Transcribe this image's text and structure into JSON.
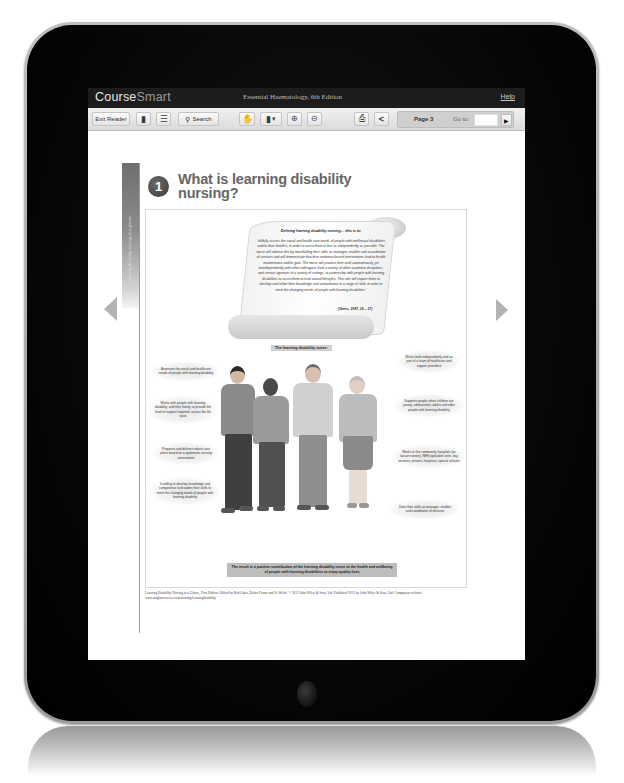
{
  "app": {
    "logo_main": "Course",
    "logo_accent": "Smart",
    "book_title": "Essential Haematology, 6th Edition",
    "help_label": "Help"
  },
  "toolbar": {
    "exit_reader_label": "Exit Reader",
    "page_icon": "page-icon",
    "toc_icon": "list-icon",
    "search_label": "Search",
    "search_icon": "magnifier-icon",
    "pan_icon": "hand-icon",
    "view_mode_icon": "page-view-icon",
    "zoom_in_icon": "zoom-in-icon",
    "zoom_out_icon": "zoom-out-icon",
    "print_icon": "printer-icon",
    "share_icon": "share-icon",
    "page_label": "Page 3",
    "goto_label": "Go to:",
    "goto_value": "",
    "goto_button_icon": "play-icon"
  },
  "navigation": {
    "prev_icon": "left-triangle-icon",
    "next_icon": "right-triangle-icon"
  },
  "page": {
    "side_strip_text": "Learning disability nursing at a glance",
    "chapter_number": "1",
    "chapter_title": "What is learning disability nursing?",
    "scroll": {
      "heading": "Defining learning disability nursing… this is to:",
      "body": "'skilfully assess the social and health care needs of people with intellectual disabilities and/or their families, in order to assist them to live as independently as possible. The nurse will achieve this by marshalling their skills as manager, enabler and co-ordinator of services and will demonstrate that their evidence-based interventions lead to health maintenance and/or gain. The nurse will practise their craft autonomously yet interdependently with other colleagues from a variety of other academic disciplines, and service agencies in a variety of settings, in partnership with people with learning disabilities to assist them to lead valued lifestyles. This role will require them to develop and refine their knowledge and competence in a range of skills in order to meet the changing needs of people with learning disabilities.'",
      "citation": "(Gates, 1997, 16 – 17)"
    },
    "illustration_title": "The learning disability nurse:",
    "callouts_left": [
      "Assesses the social and healthcare needs of people with learning disability",
      "Works with people with learning disability, and their family, to provide the level of support required, across the life span",
      "Prepares and delivers robust care plans based on a systematic nursing assessment",
      "Is willing to develop knowledge and competence to broaden their skills to meet the changing needs of people with learning disability"
    ],
    "callouts_right": [
      "Works both independently and as part of a team of healthcare and support providers",
      "Supports people when children are young, adolescents, adults and older people with learning disability",
      "Works in the community, hospitals (as liaison nurses), NHS specialist units, day services, prisons, hospices, special schools",
      "Uses their skills as manager, enabler and coordinator of services"
    ],
    "result_banner": "The result is a positive contribution of the learning disability nurse to the health and wellbeing of people with learning disabilities to enjoy quality lives",
    "footer_credit": "Learning Disability Nursing at a Glance, First Edition. Edited by Bob Gates, Debra Fearns and Jo Welch. © 2015 John Wiley & Sons, Ltd. Published 2015 by John Wiley & Sons, Ltd. Companion website: www.ataglanceseries.com/nursing/learningdisability"
  },
  "colors": {
    "header_bg": "#1c1c1c",
    "toolbar_bg": "#e6e6e6",
    "page_box_bg": "#cfcfcf",
    "bezel": "#050505",
    "arrow": "#b3b3b3"
  }
}
